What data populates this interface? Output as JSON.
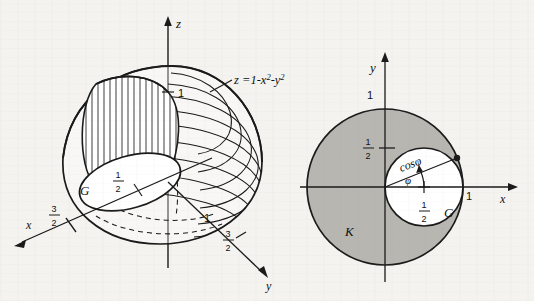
{
  "figure": {
    "background_color": "#f4f3f0",
    "ink_color": "#1a1a1a",
    "shade_color": "#b8b6b1"
  },
  "left_diagram": {
    "name": "3d-paraboloid-plot",
    "surface_equation": "z =1-x²-y²",
    "axes": [
      {
        "id": "x",
        "label": "x",
        "ticks": [
          {
            "value": "3/2",
            "numerator": "3",
            "denominator": "2"
          }
        ]
      },
      {
        "id": "y",
        "label": "y",
        "ticks": [
          {
            "value": "1"
          },
          {
            "value": "3/2",
            "numerator": "3",
            "denominator": "2"
          }
        ]
      },
      {
        "id": "z",
        "label": "z",
        "ticks": [
          {
            "value": "1"
          }
        ]
      }
    ],
    "region_label": "G",
    "region_radius_label": {
      "numerator": "1",
      "denominator": "2"
    },
    "top_value_label": "1",
    "y_value_label": "1",
    "x_tick_label": {
      "numerator": "3",
      "denominator": "2"
    },
    "y_tick_label": {
      "numerator": "3",
      "denominator": "2"
    }
  },
  "right_diagram": {
    "name": "polar-region-plot",
    "axes": [
      {
        "id": "x",
        "label": "x",
        "ticks": [
          {
            "value": "1"
          }
        ]
      },
      {
        "id": "y",
        "label": "y",
        "ticks": [
          {
            "value": "1"
          },
          {
            "value": "1/2",
            "numerator": "1",
            "denominator": "2"
          }
        ]
      }
    ],
    "outer_disk_label": "K",
    "inner_disk_label": "G",
    "radius_label": "cosφ",
    "angle_label": "φ",
    "y_tick_one": "1",
    "y_tick_half": {
      "numerator": "1",
      "denominator": "2"
    },
    "x_tick_one": "1",
    "inner_center_label": {
      "numerator": "1",
      "denominator": "2"
    }
  }
}
